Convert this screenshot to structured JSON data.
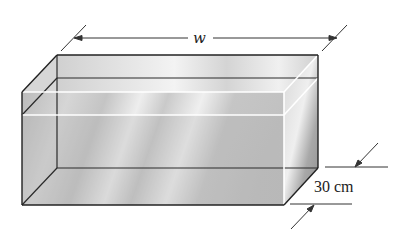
{
  "figure": {
    "labels": {
      "width": "w",
      "depth": "30 cm"
    },
    "colors": {
      "edge": "#222222",
      "glass_light": "#f2f2f2",
      "glass_mid": "#c8c8c8",
      "glass_dark": "#9a9a9a",
      "water_line": "#ffffff",
      "dimension_line": "#333333"
    }
  }
}
